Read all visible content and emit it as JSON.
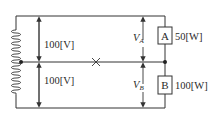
{
  "diagram": {
    "type": "three-wire single-phase circuit",
    "source_upper_voltage": "100[V]",
    "source_lower_voltage": "100[V]",
    "voltage_label_a": "V",
    "voltage_label_a_sub": "A",
    "voltage_label_b": "V",
    "voltage_label_b_sub": "B",
    "load_a": {
      "name": "A",
      "power": "50[W]"
    },
    "load_b": {
      "name": "B",
      "power": "100[W]"
    },
    "neutral_break_mark": "×",
    "colors": {
      "line": "#333333",
      "background": "#ffffff"
    }
  }
}
